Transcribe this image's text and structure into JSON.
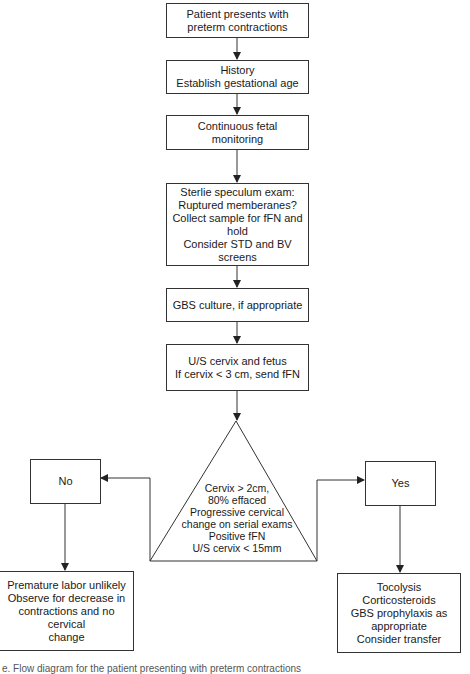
{
  "flowchart": {
    "steps": [
      {
        "id": "presentation",
        "text": "Patient presents with\npreterm contractions"
      },
      {
        "id": "history",
        "text": "History\nEstablish gestational age"
      },
      {
        "id": "monitoring",
        "text": "Continuous fetal monitoring"
      },
      {
        "id": "speculum",
        "text": "Sterlie speculum exam:\nRuptured memberanes?\nCollect sample for fFN and\nhold\nConsider STD and BV\nscreens"
      },
      {
        "id": "gbs",
        "text": "GBS culture, if appropriate"
      },
      {
        "id": "ultrasound",
        "text": "U/S cervix and fetus\nIf cervix < 3 cm, send fFN"
      }
    ],
    "decision": {
      "text": "Cervix > 2cm,\n80% effaced\nProgressive cervical\nchange on serial exams\nPositive fFN\nU/S cervix < 15mm"
    },
    "branches": {
      "no": {
        "label": "No",
        "outcome": "Premature labor unlikely\nObserve for decrease in\ncontractions and no cervical\nchange"
      },
      "yes": {
        "label": "Yes",
        "outcome": "Tocolysis\nCorticosteroids\nGBS prophylaxis as\nappropriate\nConsider transfer"
      }
    },
    "caption": "e. Flow diagram for the patient presenting with preterm contractions"
  },
  "colors": {
    "line": "#333333",
    "text": "#1a1a1a",
    "background": "#ffffff"
  }
}
